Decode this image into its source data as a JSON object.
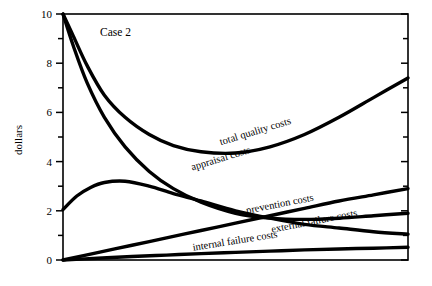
{
  "chart_data": {
    "type": "line",
    "title": "",
    "annotation": "Case 2",
    "xlabel": "",
    "ylabel": "dollars",
    "ylim": [
      0,
      10
    ],
    "xlim": [
      0,
      10
    ],
    "grid": false,
    "legend_position": "inline-labels",
    "y_ticks_major": [
      "0",
      "2",
      "4",
      "6",
      "8",
      "10"
    ],
    "y_ticks_major_values": [
      0,
      2,
      4,
      6,
      8,
      10
    ],
    "y_ticks_minor_values": [
      1,
      3,
      5,
      7,
      9
    ],
    "x_ticks": [],
    "x_tick_labels": [],
    "series": [
      {
        "name": "total quality costs",
        "label": "total quality costs",
        "label_x": 5.6,
        "label_y": 5.1,
        "label_rotation": -17,
        "x": [
          0,
          0.3,
          0.7,
          1.2,
          1.8,
          2.5,
          3.2,
          4.0,
          5.0,
          6.0,
          7.0,
          8.0,
          9.0,
          10.0
        ],
        "y": [
          10.0,
          9.1,
          7.9,
          6.7,
          5.8,
          5.1,
          4.65,
          4.4,
          4.35,
          4.6,
          5.1,
          5.8,
          6.6,
          7.4
        ]
      },
      {
        "name": "appraisal costs",
        "label": "appraisal costs",
        "label_x": 4.6,
        "label_y": 4.0,
        "label_rotation": -17,
        "x": [
          0,
          0.3,
          0.7,
          1.2,
          1.8,
          2.5,
          3.2,
          4.0,
          5.0,
          6.0,
          7.0,
          8.0,
          9.0,
          10.0
        ],
        "y": [
          10.0,
          8.7,
          7.2,
          5.8,
          4.6,
          3.6,
          2.9,
          2.35,
          1.9,
          1.7,
          1.65,
          1.7,
          1.8,
          1.9
        ]
      },
      {
        "name": "prevention costs",
        "label": "prevention costs",
        "label_x": 6.3,
        "label_y": 2.15,
        "label_rotation": -11,
        "x": [
          0,
          1,
          2,
          3,
          4,
          5,
          6,
          7,
          8,
          9,
          10
        ],
        "y": [
          0.0,
          0.3,
          0.6,
          0.9,
          1.2,
          1.5,
          1.8,
          2.1,
          2.4,
          2.65,
          2.9
        ]
      },
      {
        "name": "external failure costs",
        "label": "external failure costs",
        "label_x": 7.3,
        "label_y": 1.45,
        "label_rotation": -11,
        "x": [
          0,
          0.4,
          0.8,
          1.2,
          1.8,
          2.5,
          3.2,
          4.0,
          5.0,
          6.0,
          7.0,
          8.0,
          9.0,
          10.0
        ],
        "y": [
          2.05,
          2.6,
          2.95,
          3.15,
          3.2,
          3.0,
          2.7,
          2.4,
          2.0,
          1.7,
          1.45,
          1.3,
          1.15,
          1.05
        ]
      },
      {
        "name": "internal failure costs",
        "label": "internal failure costs",
        "label_x": 5.0,
        "label_y": 0.65,
        "label_rotation": -9,
        "x": [
          0,
          1,
          2,
          3,
          4,
          5,
          6,
          7,
          8,
          9,
          10
        ],
        "y": [
          0.0,
          0.07,
          0.14,
          0.2,
          0.26,
          0.31,
          0.36,
          0.41,
          0.45,
          0.48,
          0.52
        ]
      }
    ]
  }
}
